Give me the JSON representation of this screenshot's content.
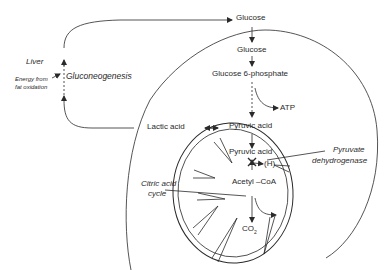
{
  "diagram": {
    "labels": {
      "glucose_blood": "Glucose",
      "glucose_cell": "Glucose",
      "g6p": "Glucose 6-phosphate",
      "atp": "ATP",
      "pyruvic_cyto": "Pyruvic acid",
      "lactic": "Lactic acid",
      "pyruvic_mito": "Pyruvic acid",
      "h": "(H)",
      "acetyl": "Acetyl –CoA",
      "co2": "CO",
      "co2_sub": "2",
      "liver": "Liver",
      "energy_line1": "Energy from",
      "energy_line2": "fat oxidation",
      "gluconeo": "Gluconeogenesis",
      "pdh_line1": "Pyruvate",
      "pdh_line2": "dehydrogenase",
      "cac_line1": "Citric acid",
      "cac_line2": "cycle"
    },
    "colors": {
      "stroke": "#2a2a2a",
      "background": "#ffffff"
    }
  }
}
